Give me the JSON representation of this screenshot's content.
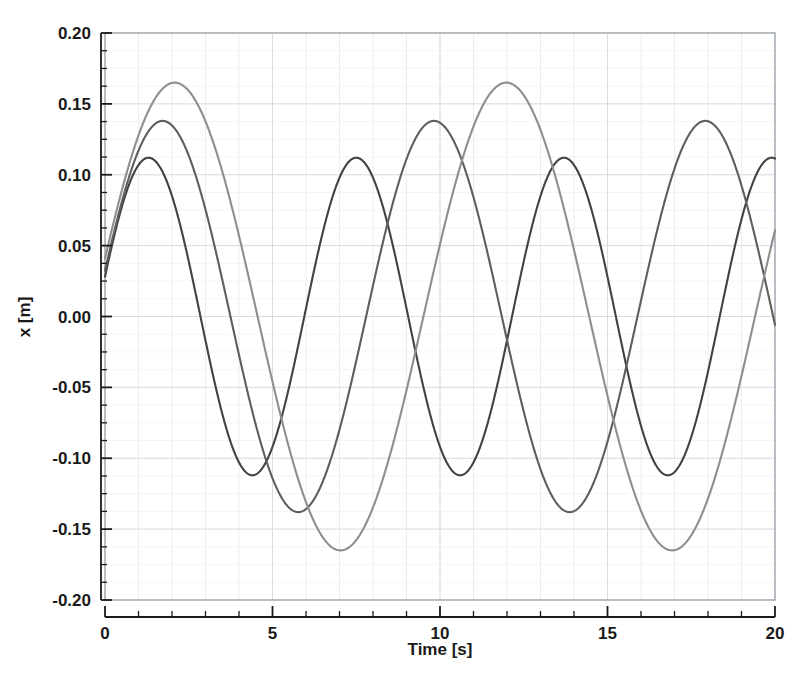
{
  "chart_data": {
    "type": "line",
    "title": "",
    "subtitle": "",
    "xlabel": "Time [s]",
    "ylabel": "x [m]",
    "xlim": [
      0,
      20
    ],
    "ylim": [
      -0.2,
      0.2
    ],
    "xticks": [
      0,
      5,
      10,
      15,
      20
    ],
    "xticklabels": [
      "0",
      "5",
      "10",
      "15",
      "20"
    ],
    "xminortick_step": 1,
    "yticks": [
      -0.2,
      -0.15,
      -0.1,
      -0.05,
      0.0,
      0.05,
      0.1,
      0.15,
      0.2
    ],
    "yticklabels": [
      "-0.20",
      "-0.15",
      "-0.10",
      "-0.05",
      "0.00",
      "0.05",
      "0.10",
      "0.15",
      "0.20"
    ],
    "yminortick_step": 0.0125,
    "grid": true,
    "grid_color": "#d9dde2",
    "legend": null,
    "legend_position": "none",
    "background": "#ffffff",
    "frame_color": "#9aa0a6",
    "series": [
      {
        "name": "curve-dark",
        "color": "#424242",
        "linewidth": 2.1,
        "amplitude": 0.112,
        "period": 6.2,
        "phase_offset_s": 1.3,
        "x0": 0.05,
        "peaks_t": [
          1.3,
          7.4,
          13.7,
          19.9
        ],
        "peaks_x": [
          0.112,
          0.112,
          0.112,
          0.112
        ],
        "troughs_t": [
          4.2,
          10.5,
          16.8
        ],
        "troughs_x": [
          -0.112,
          -0.112,
          -0.112
        ],
        "value_at_t20": 0.111
      },
      {
        "name": "curve-medium",
        "color": "#5e5e5e",
        "linewidth": 2.1,
        "amplitude": 0.138,
        "period": 8.1,
        "phase_offset_s": 1.72,
        "x0": 0.05,
        "peaks_t": [
          1.72,
          9.75,
          17.8
        ],
        "peaks_x": [
          0.138,
          0.138,
          0.138
        ],
        "troughs_t": [
          5.7,
          13.8
        ],
        "troughs_x": [
          -0.138,
          -0.138
        ],
        "value_at_t20": 0.06
      },
      {
        "name": "curve-light",
        "color": "#8e8e8e",
        "linewidth": 2.1,
        "amplitude": 0.165,
        "period": 9.9,
        "phase_offset_s": 2.08,
        "x0": 0.05,
        "peaks_t": [
          2.08,
          11.95
        ],
        "peaks_x": [
          0.165,
          0.165
        ],
        "troughs_t": [
          7.0,
          16.9
        ],
        "troughs_x": [
          -0.165,
          -0.165
        ],
        "value_at_t20": -0.022
      }
    ]
  },
  "axes": {
    "x_title": "Time [s]",
    "y_title": "x [m]"
  }
}
